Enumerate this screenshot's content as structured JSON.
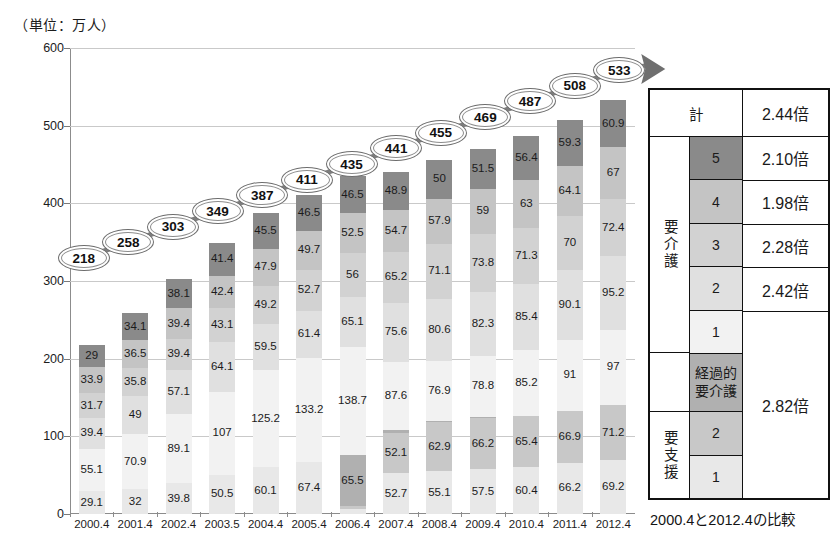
{
  "unit_label": "（単位：万人）",
  "caption": "2000.4と2012.4の比較",
  "chart_data": {
    "type": "bar",
    "stacked": true,
    "title": "",
    "xlabel": "",
    "ylabel": "（単位：万人）",
    "ylim": [
      0,
      600
    ],
    "yticks": [
      0,
      100,
      200,
      300,
      400,
      500,
      600
    ],
    "grid": true,
    "legend_position": "right-table",
    "categories": [
      "2000.4",
      "2001.4",
      "2002.4",
      "2003.5",
      "2004.4",
      "2005.4",
      "2006.4",
      "2007.4",
      "2008.4",
      "2009.4",
      "2010.4",
      "2011.4",
      "2012.4"
    ],
    "series": [
      {
        "name": "要支援1",
        "color": "#e8e8e8",
        "values": [
          29.1,
          32,
          39.8,
          50.5,
          60.1,
          67.4,
          5.9,
          52.7,
          55.1,
          57.5,
          60.4,
          66.2,
          69.2
        ]
      },
      {
        "name": "要支援2",
        "color": "#c8c8c8",
        "values": [
          null,
          null,
          null,
          null,
          null,
          null,
          4.5,
          52.1,
          62.9,
          66.2,
          65.4,
          66.9,
          71.2
        ]
      },
      {
        "name": "経過的要介護",
        "color": "#b0b0b0",
        "values": [
          null,
          null,
          null,
          null,
          null,
          null,
          65.5,
          4,
          0.1,
          0,
          null,
          null,
          null
        ]
      },
      {
        "name": "要介護1",
        "color": "#f2f2f2",
        "values": [
          55.1,
          70.9,
          89.1,
          107,
          125.2,
          133.2,
          138.7,
          87.6,
          76.9,
          78.8,
          85.2,
          91,
          97
        ]
      },
      {
        "name": "要介護2",
        "color": "#e0e0e0",
        "values": [
          39.4,
          49,
          57.1,
          64.1,
          59.5,
          61.4,
          65.1,
          75.6,
          80.6,
          82.3,
          85.4,
          90.1,
          95.2
        ]
      },
      {
        "name": "要介護3",
        "color": "#d2d2d2",
        "values": [
          31.7,
          35.8,
          39.4,
          43.1,
          49.2,
          52.7,
          56,
          65.2,
          71.1,
          73.8,
          71.3,
          70,
          72.4
        ]
      },
      {
        "name": "要介護4",
        "color": "#c4c4c4",
        "values": [
          33.9,
          36.5,
          39.4,
          42.4,
          47.9,
          49.7,
          52.5,
          54.7,
          57.9,
          59,
          63,
          64.1,
          67
        ]
      },
      {
        "name": "要介護5",
        "color": "#8a8a8a",
        "values": [
          29,
          34.1,
          38.1,
          41.4,
          45.5,
          46.5,
          46.5,
          48.9,
          50,
          51.5,
          56.4,
          59.3,
          60.9
        ]
      }
    ],
    "totals": [
      218,
      258,
      303,
      349,
      387,
      411,
      435,
      441,
      455,
      469,
      487,
      508,
      533
    ],
    "total_bubble_note": "総数（万人）"
  },
  "legend_table": {
    "total_row": {
      "label": "計",
      "value": "2.44倍"
    },
    "groups": [
      {
        "name": "要介護",
        "levels": [
          {
            "level": "5",
            "swatch": "#8a8a8a",
            "value": "2.10倍"
          },
          {
            "level": "4",
            "swatch": "#c4c4c4",
            "value": "1.98倍"
          },
          {
            "level": "3",
            "swatch": "#d2d2d2",
            "value": "2.28倍"
          },
          {
            "level": "2",
            "swatch": "#e0e0e0",
            "value": "2.42倍"
          },
          {
            "level": "1",
            "swatch": "#f2f2f2",
            "value": ""
          }
        ]
      },
      {
        "name": "経過的\n要介護",
        "levels": [
          {
            "level": "",
            "swatch": "#b0b0b0",
            "value": "2.82倍"
          }
        ]
      },
      {
        "name": "要支援",
        "levels": [
          {
            "level": "2",
            "swatch": "#c8c8c8",
            "value": ""
          },
          {
            "level": "1",
            "swatch": "#e8e8e8",
            "value": ""
          }
        ]
      }
    ],
    "merged_value": "2.82倍"
  },
  "colors": {
    "axis": "#8c8c8c",
    "grid": "#c9c9c9",
    "bubble_border": "#6d6d6d",
    "text": "#1a1a1a"
  }
}
